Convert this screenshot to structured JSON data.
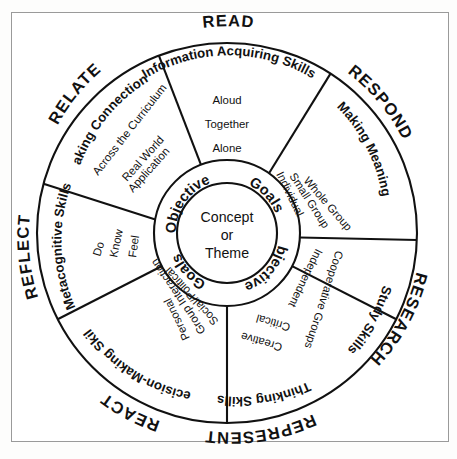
{
  "diagram": {
    "center": {
      "inner_lines": [
        "Concept",
        "or",
        "Theme"
      ],
      "ring_words": [
        "Objectives",
        "Goals",
        "Objectives",
        "Goals"
      ]
    },
    "sectors": [
      {
        "id": "read",
        "outer_label": "READ",
        "title": "Information Acquiring Skills",
        "items": [
          "Aloud",
          "Together",
          "Alone"
        ]
      },
      {
        "id": "respond",
        "outer_label": "RESPOND",
        "title": "Making Meaning",
        "items": [
          "Whole Group",
          "Small Group",
          "Individual"
        ]
      },
      {
        "id": "research",
        "outer_label": "RESEARCH",
        "title": "Study Skills",
        "items": [
          "Cooperative Groups",
          "Independent"
        ]
      },
      {
        "id": "represent",
        "outer_label": "REPRESENT",
        "title": "Thinking Skills",
        "items": [
          "Critical",
          "Creative"
        ]
      },
      {
        "id": "react",
        "outer_label": "REACT",
        "title": "Decision-Making Skills",
        "items": [
          "Social/Political",
          "Group Interaction",
          "Personal"
        ]
      },
      {
        "id": "reflect",
        "outer_label": "REFLECT",
        "title": "Metacognitive Skills",
        "items": [
          "Do",
          "Know",
          "Feel"
        ]
      },
      {
        "id": "relate",
        "outer_label": "RELATE",
        "title": "Making Connections",
        "items": [
          "Across the Curriculum",
          "Real World",
          "Application"
        ]
      }
    ],
    "colors": {
      "stroke": "#111111",
      "background": "#ffffff",
      "frame": "#9a9a9a"
    }
  }
}
